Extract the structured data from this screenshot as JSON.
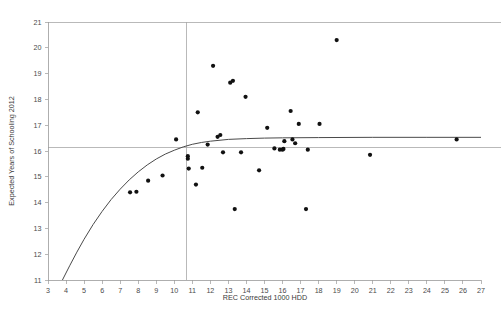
{
  "chart_data": {
    "type": "scatter",
    "title": "",
    "xlabel": "REC Corrected 1000 HDD",
    "ylabel": "Expected Years of Schooling 2012",
    "xlim": [
      3,
      27
    ],
    "ylim": [
      11,
      21
    ],
    "xticks": [
      3,
      4,
      5,
      6,
      7,
      8,
      9,
      10,
      11,
      12,
      13,
      14,
      15,
      16,
      17,
      18,
      19,
      20,
      21,
      22,
      23,
      24,
      25,
      26,
      27
    ],
    "yticks": [
      11,
      12,
      13,
      14,
      15,
      16,
      17,
      18,
      19,
      20,
      21
    ],
    "grid": false,
    "legend": "none",
    "point_color": "#111111",
    "curve_color": "#4a4a4a",
    "reference_lines": [
      {
        "orientation": "horizontal",
        "value": 16.15,
        "color": "#a8a8a8"
      },
      {
        "orientation": "vertical",
        "value": 10.65,
        "color": "#a8a8a8"
      }
    ],
    "fit_curve": {
      "description": "concave increasing logarithmic-style fit, rises steeply from 11 at x=3.8 then plateaus near 16.5",
      "points": [
        [
          3.8,
          11.0
        ],
        [
          4.2,
          11.55
        ],
        [
          4.6,
          12.08
        ],
        [
          5.0,
          12.58
        ],
        [
          5.5,
          13.15
        ],
        [
          6.0,
          13.66
        ],
        [
          6.5,
          14.12
        ],
        [
          7.0,
          14.52
        ],
        [
          7.5,
          14.88
        ],
        [
          8.0,
          15.19
        ],
        [
          8.5,
          15.46
        ],
        [
          9.0,
          15.69
        ],
        [
          9.5,
          15.88
        ],
        [
          10.0,
          16.03
        ],
        [
          10.5,
          16.16
        ],
        [
          11.0,
          16.26
        ],
        [
          11.5,
          16.33
        ],
        [
          12.0,
          16.38
        ],
        [
          13.0,
          16.45
        ],
        [
          14.0,
          16.48
        ],
        [
          15.0,
          16.5
        ],
        [
          16.0,
          16.51
        ],
        [
          18.0,
          16.52
        ],
        [
          21.0,
          16.53
        ],
        [
          24.0,
          16.53
        ],
        [
          27.0,
          16.53
        ]
      ]
    },
    "series": [
      {
        "name": "Countries",
        "points": [
          [
            7.55,
            14.4
          ],
          [
            7.9,
            14.42
          ],
          [
            8.55,
            14.85
          ],
          [
            9.35,
            15.05
          ],
          [
            10.1,
            16.45
          ],
          [
            10.75,
            15.8
          ],
          [
            10.75,
            15.7
          ],
          [
            10.8,
            15.32
          ],
          [
            11.2,
            14.7
          ],
          [
            11.3,
            17.5
          ],
          [
            11.55,
            15.35
          ],
          [
            11.85,
            16.25
          ],
          [
            12.15,
            19.3
          ],
          [
            12.4,
            16.55
          ],
          [
            12.55,
            16.62
          ],
          [
            12.7,
            15.95
          ],
          [
            13.1,
            18.65
          ],
          [
            13.25,
            18.72
          ],
          [
            13.35,
            13.75
          ],
          [
            13.7,
            15.95
          ],
          [
            13.95,
            18.1
          ],
          [
            14.7,
            15.25
          ],
          [
            15.15,
            16.9
          ],
          [
            15.55,
            16.1
          ],
          [
            15.85,
            16.05
          ],
          [
            16.0,
            16.05
          ],
          [
            16.05,
            16.08
          ],
          [
            16.1,
            16.38
          ],
          [
            16.45,
            17.55
          ],
          [
            16.55,
            16.45
          ],
          [
            16.7,
            16.3
          ],
          [
            16.9,
            17.05
          ],
          [
            17.3,
            13.75
          ],
          [
            17.4,
            16.05
          ],
          [
            18.05,
            17.05
          ],
          [
            19.0,
            20.3
          ],
          [
            20.85,
            15.85
          ],
          [
            25.65,
            16.45
          ]
        ]
      }
    ]
  }
}
